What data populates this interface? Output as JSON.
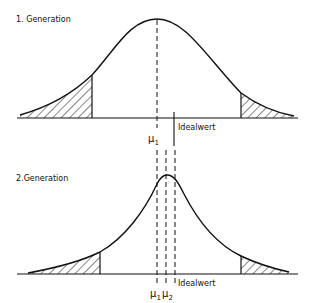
{
  "panels": [
    {
      "title": "1. Generation",
      "labels": {
        "mu1": "μ",
        "mu1_sub": "1",
        "ideal": "Idealwert"
      }
    },
    {
      "title": "2.Generation",
      "labels": {
        "mu1": "μ",
        "mu1_sub": "1",
        "mu2": "μ",
        "mu2_sub": "2",
        "ideal": "Idealwert"
      }
    }
  ],
  "colors": {
    "stroke": "#111111",
    "background": "#ffffff"
  }
}
